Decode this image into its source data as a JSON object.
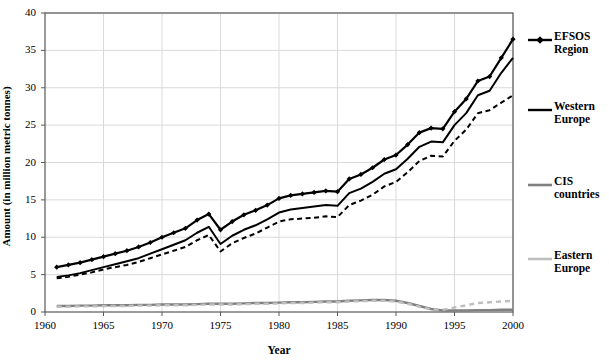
{
  "chart_data": {
    "type": "line",
    "title": "",
    "xlabel": "Year",
    "ylabel": "Amount (in million metric tonnes)",
    "xlim": [
      1960,
      2000
    ],
    "ylim": [
      0,
      40
    ],
    "xticks": [
      1960,
      1965,
      1970,
      1975,
      1980,
      1985,
      1990,
      1995,
      2000
    ],
    "yticks": [
      0,
      5,
      10,
      15,
      20,
      25,
      30,
      35,
      40
    ],
    "grid": "horizontal-and-vertical-light",
    "legend_position": "right",
    "x": [
      1961,
      1962,
      1963,
      1964,
      1965,
      1966,
      1967,
      1968,
      1969,
      1970,
      1971,
      1972,
      1973,
      1974,
      1975,
      1976,
      1977,
      1978,
      1979,
      1980,
      1981,
      1982,
      1983,
      1984,
      1985,
      1986,
      1987,
      1988,
      1989,
      1990,
      1991,
      1992,
      1993,
      1994,
      1995,
      1996,
      1997,
      1998,
      1999,
      2000
    ],
    "series": [
      {
        "name": "EFSOS Region",
        "color": "#000000",
        "style": "solid-with-diamond-markers",
        "values": [
          6.0,
          6.3,
          6.6,
          7.0,
          7.4,
          7.8,
          8.2,
          8.7,
          9.3,
          10.0,
          10.6,
          11.2,
          12.3,
          13.1,
          11.0,
          12.1,
          13.0,
          13.6,
          14.3,
          15.2,
          15.6,
          15.8,
          16.0,
          16.2,
          16.1,
          17.8,
          18.4,
          19.3,
          20.4,
          21.0,
          22.4,
          24.0,
          24.6,
          24.5,
          26.8,
          28.5,
          30.9,
          31.5,
          34.0,
          36.5
        ]
      },
      {
        "name": "Western Europe",
        "color": "#000000",
        "style": "solid",
        "values": [
          4.7,
          4.9,
          5.2,
          5.6,
          6.0,
          6.4,
          6.8,
          7.2,
          7.8,
          8.4,
          9.0,
          9.6,
          10.6,
          11.4,
          9.1,
          10.2,
          11.0,
          11.6,
          12.4,
          13.3,
          13.7,
          13.9,
          14.1,
          14.3,
          14.2,
          15.9,
          16.5,
          17.4,
          18.5,
          19.1,
          20.5,
          22.1,
          22.8,
          22.7,
          25.0,
          26.6,
          29.0,
          29.6,
          32.0,
          34.0
        ]
      },
      {
        "name": "EFSOS Region (dashed lower band)",
        "color": "#000000",
        "style": "dashed",
        "values": [
          4.5,
          4.7,
          5.0,
          5.3,
          5.7,
          6.0,
          6.3,
          6.7,
          7.2,
          7.7,
          8.2,
          8.7,
          9.6,
          10.3,
          8.1,
          9.2,
          9.9,
          10.5,
          11.3,
          12.1,
          12.4,
          12.5,
          12.6,
          12.8,
          12.7,
          14.3,
          14.9,
          15.7,
          16.8,
          17.4,
          18.7,
          20.2,
          20.9,
          20.8,
          22.9,
          24.4,
          26.6,
          27.0,
          28.0,
          29.0
        ]
      },
      {
        "name": "CIS countries",
        "color": "#808080",
        "style": "solid",
        "values": [
          0.8,
          0.8,
          0.85,
          0.85,
          0.9,
          0.9,
          0.9,
          0.95,
          0.95,
          1.0,
          1.0,
          1.0,
          1.05,
          1.1,
          1.1,
          1.1,
          1.15,
          1.2,
          1.2,
          1.25,
          1.3,
          1.3,
          1.35,
          1.4,
          1.4,
          1.5,
          1.55,
          1.6,
          1.6,
          1.5,
          1.2,
          0.8,
          0.4,
          0.2,
          0.2,
          0.2,
          0.25,
          0.25,
          0.3,
          0.3
        ]
      },
      {
        "name": "Eastern Europe",
        "color": "#bfbfbf",
        "style": "dashed",
        "values": [
          0.7,
          0.7,
          0.75,
          0.75,
          0.8,
          0.8,
          0.8,
          0.85,
          0.85,
          0.9,
          0.9,
          0.9,
          0.95,
          1.0,
          1.0,
          1.0,
          1.05,
          1.1,
          1.1,
          1.15,
          1.2,
          1.2,
          1.25,
          1.3,
          1.3,
          1.4,
          1.45,
          1.5,
          1.5,
          1.4,
          1.1,
          0.7,
          0.35,
          0.3,
          0.6,
          0.9,
          1.2,
          1.3,
          1.4,
          1.5
        ]
      }
    ]
  },
  "axes": {
    "y_ticks": [
      "0",
      "5",
      "10",
      "15",
      "20",
      "25",
      "30",
      "35",
      "40"
    ],
    "x_ticks": [
      "1960",
      "1965",
      "1970",
      "1975",
      "1980",
      "1985",
      "1990",
      "1995",
      "2000"
    ],
    "y_title": "Amount (in million metric tonnes)",
    "x_title": "Year"
  },
  "legend": {
    "items": [
      {
        "label_line1": "EFSOS",
        "label_line2": "Region",
        "color": "#000000",
        "marker": "diamond"
      },
      {
        "label_line1": "Western",
        "label_line2": "Europe",
        "color": "#000000",
        "marker": "none"
      },
      {
        "label_line1": "CIS",
        "label_line2": "countries",
        "color": "#808080",
        "marker": "none"
      },
      {
        "label_line1": "Eastern",
        "label_line2": "Europe",
        "color": "#bfbfbf",
        "marker": "none"
      }
    ]
  }
}
